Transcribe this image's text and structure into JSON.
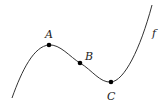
{
  "diagram": {
    "type": "function-curve",
    "curve_label": "f",
    "points": [
      {
        "id": "A",
        "label": "A",
        "role": "local maximum",
        "x": 49,
        "y": 45
      },
      {
        "id": "B",
        "label": "B",
        "role": "inflection point",
        "x": 80,
        "y": 63
      },
      {
        "id": "C",
        "label": "C",
        "role": "local minimum",
        "x": 111,
        "y": 82
      }
    ],
    "colors": {
      "curve": "#333333",
      "point": "#000000",
      "label": "#222222"
    }
  }
}
